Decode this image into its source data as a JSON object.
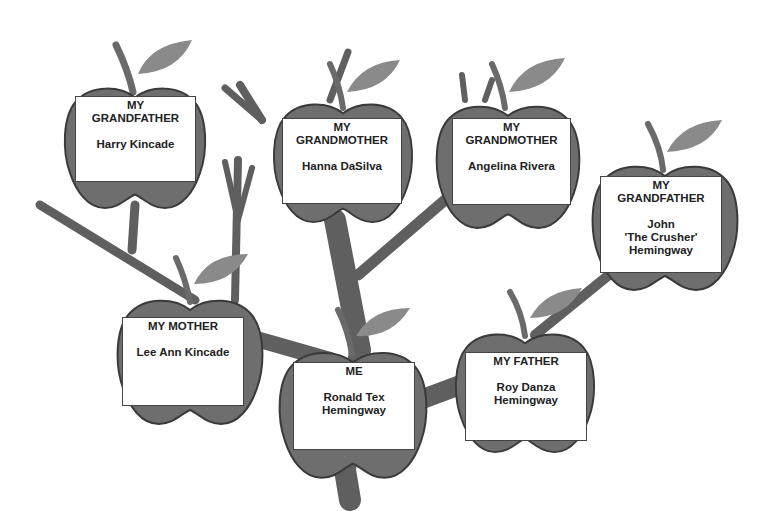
{
  "colors": {
    "apple": "#6e6e6e",
    "apple_outline": "#3a3a3a",
    "branch": "#6a6a6a",
    "leaf": "#8a8a8a",
    "card_bg": "#ffffff",
    "text": "#222222"
  },
  "members": [
    {
      "id": "grandfather-1",
      "role_lines": [
        "MY",
        "GRANDFATHER"
      ],
      "name_lines": [
        "Harry Kincade"
      ]
    },
    {
      "id": "grandmother-1",
      "role_lines": [
        "MY",
        "GRANDMOTHER"
      ],
      "name_lines": [
        "Hanna DaSilva"
      ]
    },
    {
      "id": "grandmother-2",
      "role_lines": [
        "MY",
        "GRANDMOTHER"
      ],
      "name_lines": [
        "Angelina Rivera"
      ]
    },
    {
      "id": "grandfather-2",
      "role_lines": [
        "MY",
        "GRANDFATHER"
      ],
      "name_lines": [
        "John",
        "'The Crusher'",
        "Hemingway"
      ]
    },
    {
      "id": "mother",
      "role_lines": [
        "MY MOTHER"
      ],
      "name_lines": [
        "Lee Ann Kincade"
      ]
    },
    {
      "id": "me",
      "role_lines": [
        "ME"
      ],
      "name_lines": [
        "Ronald Tex",
        "Hemingway"
      ]
    },
    {
      "id": "father",
      "role_lines": [
        "MY FATHER"
      ],
      "name_lines": [
        "Roy Danza",
        "Hemingway"
      ]
    }
  ]
}
